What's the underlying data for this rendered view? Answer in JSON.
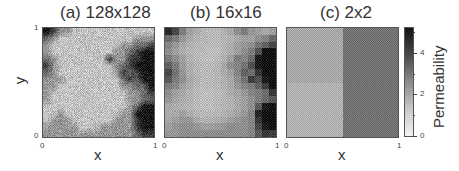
{
  "chart_data": [
    {
      "type": "heatmap",
      "title": "(a) 128x128",
      "xlabel": "x",
      "ylabel": "y",
      "xlim": [
        0,
        1
      ],
      "ylim": [
        0,
        1
      ],
      "x_ticks": [
        "0",
        "1"
      ],
      "y_ticks": [
        "0",
        "1"
      ],
      "resolution": "128x128",
      "description": "Fine-scale permeability field; mostly low-to-moderate (light grey) with a high-permeability (dark) region along the right edge and top-left corner",
      "approx_grid_16x16": [
        [
          5,
          4,
          2,
          2,
          1,
          1,
          1,
          1,
          1,
          1,
          1,
          1,
          1,
          1,
          1,
          1
        ],
        [
          3,
          2,
          1,
          1,
          1,
          1,
          1,
          1,
          1,
          1,
          1,
          1,
          1,
          2,
          2,
          2
        ],
        [
          2,
          1,
          1,
          1,
          1,
          1,
          1,
          1,
          1,
          1,
          1,
          2,
          2,
          3,
          3,
          4
        ],
        [
          2,
          1,
          1,
          1,
          1,
          1,
          1,
          1,
          1,
          1,
          2,
          2,
          3,
          4,
          5,
          5
        ],
        [
          3,
          2,
          1,
          1,
          1,
          1,
          1,
          1,
          1,
          4,
          2,
          2,
          4,
          4,
          5,
          5
        ],
        [
          4,
          2,
          1,
          1,
          1,
          1,
          1,
          1,
          1,
          1,
          2,
          3,
          4,
          5,
          5,
          5
        ],
        [
          3,
          2,
          1,
          1,
          1,
          1,
          1,
          1,
          1,
          1,
          2,
          4,
          3,
          4,
          5,
          5
        ],
        [
          2,
          2,
          2,
          1,
          1,
          1,
          1,
          1,
          1,
          1,
          1,
          3,
          4,
          3,
          5,
          5
        ],
        [
          2,
          2,
          1,
          1,
          1,
          1,
          1,
          1,
          1,
          1,
          1,
          2,
          2,
          3,
          3,
          5
        ],
        [
          2,
          1,
          1,
          1,
          1,
          1,
          1,
          1,
          1,
          1,
          1,
          1,
          2,
          2,
          3,
          4
        ],
        [
          2,
          1,
          1,
          1,
          1,
          1,
          1,
          1,
          1,
          1,
          1,
          1,
          2,
          2,
          3,
          3
        ],
        [
          1,
          1,
          1,
          1,
          1,
          1,
          1,
          1,
          1,
          1,
          1,
          1,
          2,
          3,
          5,
          5
        ],
        [
          1,
          1,
          2,
          1,
          1,
          1,
          1,
          1,
          1,
          1,
          1,
          2,
          2,
          5,
          5,
          5
        ],
        [
          1,
          2,
          2,
          2,
          1,
          1,
          1,
          1,
          1,
          1,
          2,
          2,
          2,
          4,
          5,
          5
        ],
        [
          2,
          2,
          2,
          2,
          2,
          1,
          1,
          1,
          2,
          2,
          2,
          2,
          2,
          4,
          5,
          5
        ],
        [
          2,
          2,
          2,
          2,
          2,
          2,
          2,
          2,
          2,
          2,
          2,
          2,
          2,
          3,
          4,
          4
        ]
      ]
    },
    {
      "type": "heatmap",
      "title": "(b) 16x16",
      "xlabel": "x",
      "xlim": [
        0,
        1
      ],
      "ylim": [
        0,
        1
      ],
      "x_ticks": [
        "0",
        "1"
      ],
      "resolution": "16x16",
      "grid": [
        [
          4.5,
          3.8,
          2.6,
          1.8,
          1.5,
          1.3,
          1.2,
          1.2,
          1.4,
          1.6,
          2.2,
          2.6,
          2.0,
          1.8,
          1.6,
          1.8
        ],
        [
          3.0,
          2.6,
          2.0,
          1.6,
          1.4,
          1.3,
          1.2,
          1.2,
          1.3,
          1.4,
          1.6,
          1.8,
          1.8,
          2.2,
          2.4,
          3.0
        ],
        [
          2.4,
          2.0,
          1.6,
          1.4,
          1.3,
          1.2,
          1.2,
          1.2,
          1.3,
          1.5,
          1.8,
          2.0,
          2.2,
          2.8,
          3.2,
          3.8
        ],
        [
          2.2,
          1.8,
          1.5,
          1.3,
          1.2,
          1.2,
          1.1,
          1.1,
          1.3,
          1.5,
          1.8,
          2.2,
          2.6,
          3.6,
          5.0,
          5.0
        ],
        [
          2.6,
          2.2,
          1.8,
          1.4,
          1.2,
          1.1,
          1.1,
          1.2,
          1.4,
          1.8,
          2.6,
          2.4,
          3.0,
          4.8,
          5.0,
          5.0
        ],
        [
          3.2,
          2.6,
          1.9,
          1.5,
          1.3,
          1.2,
          1.2,
          1.3,
          1.6,
          2.2,
          2.4,
          2.8,
          3.6,
          4.8,
          5.0,
          5.0
        ],
        [
          3.8,
          2.8,
          2.0,
          1.5,
          1.3,
          1.2,
          1.2,
          1.3,
          1.5,
          1.8,
          2.4,
          3.2,
          3.0,
          4.2,
          5.0,
          5.0
        ],
        [
          3.4,
          2.6,
          2.2,
          1.6,
          1.4,
          1.2,
          1.2,
          1.3,
          1.4,
          1.6,
          2.2,
          2.8,
          4.0,
          3.6,
          4.8,
          5.0
        ],
        [
          2.6,
          2.4,
          1.8,
          1.5,
          1.3,
          1.2,
          1.2,
          1.2,
          1.4,
          1.6,
          2.0,
          2.4,
          2.6,
          3.2,
          4.0,
          5.0
        ],
        [
          2.2,
          1.8,
          1.6,
          1.4,
          1.2,
          1.1,
          1.1,
          1.2,
          1.3,
          1.5,
          1.7,
          2.0,
          2.4,
          2.6,
          3.0,
          4.2
        ],
        [
          2.0,
          1.7,
          1.5,
          1.4,
          1.2,
          1.1,
          1.1,
          1.2,
          1.3,
          1.4,
          1.6,
          1.8,
          2.2,
          2.6,
          3.0,
          3.4
        ],
        [
          1.6,
          1.5,
          1.4,
          1.3,
          1.2,
          1.1,
          1.1,
          1.2,
          1.3,
          1.4,
          1.6,
          1.8,
          2.2,
          3.4,
          4.8,
          5.0
        ],
        [
          1.5,
          1.6,
          1.8,
          1.5,
          1.3,
          1.2,
          1.2,
          1.3,
          1.4,
          1.5,
          1.7,
          2.0,
          2.4,
          4.6,
          5.0,
          5.0
        ],
        [
          1.6,
          1.8,
          2.0,
          2.0,
          1.6,
          1.4,
          1.4,
          1.5,
          1.6,
          1.8,
          2.0,
          2.2,
          2.4,
          4.2,
          5.0,
          5.0
        ],
        [
          1.8,
          2.0,
          2.2,
          2.2,
          2.0,
          1.8,
          1.8,
          1.9,
          2.0,
          2.2,
          2.2,
          2.2,
          2.4,
          3.8,
          4.8,
          5.0
        ],
        [
          2.0,
          2.0,
          2.2,
          2.2,
          2.2,
          2.2,
          2.2,
          2.2,
          2.2,
          2.2,
          2.2,
          2.2,
          2.4,
          3.4,
          4.2,
          4.0
        ]
      ]
    },
    {
      "type": "heatmap",
      "title": "(c) 2x2",
      "xlabel": "x",
      "xlim": [
        0,
        1
      ],
      "ylim": [
        0,
        1
      ],
      "x_ticks": [
        "0",
        "1"
      ],
      "resolution": "2x2",
      "grid": [
        [
          1.6,
          2.8
        ],
        [
          1.4,
          2.8
        ]
      ]
    }
  ],
  "colorbar": {
    "label": "Permeability",
    "min": 0,
    "max": 5.3,
    "ticks": [
      "0",
      "2",
      "4"
    ],
    "tick_values": [
      0,
      2,
      4
    ],
    "minor_tick_values": [
      1,
      3,
      5
    ],
    "colormap": "grayscale (white = low, black = high)"
  },
  "labels": {
    "panel_a_title": "(a) 128x128",
    "panel_b_title": "(b) 16x16",
    "panel_c_title": "(c) 2x2",
    "x_axis": "x",
    "y_axis": "y",
    "tick_0": "0",
    "tick_1": "1",
    "cbar_label": "Permeability",
    "cbar_0": "0",
    "cbar_2": "2",
    "cbar_4": "4"
  }
}
